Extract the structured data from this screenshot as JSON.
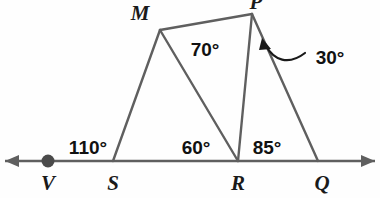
{
  "figure": {
    "background_color": "#fefefe",
    "stroke_color": "#5f5f5f",
    "label_color": "#111111",
    "line": {
      "name": "ray-VQ",
      "y": 161,
      "left_arrow_tip_x": 5,
      "right_arrow_tip_x": 375
    },
    "points": {
      "V": {
        "label": "V",
        "x": 48,
        "y": 161,
        "label_x": 48,
        "label_y": 190,
        "dot": true
      },
      "S": {
        "label": "S",
        "x": 113,
        "y": 161,
        "label_x": 113,
        "label_y": 190,
        "dot": false
      },
      "R": {
        "label": "R",
        "x": 238,
        "y": 161,
        "label_x": 238,
        "label_y": 190,
        "dot": false
      },
      "Q": {
        "label": "Q",
        "x": 318,
        "y": 161,
        "label_x": 322,
        "label_y": 190,
        "dot": false
      },
      "M": {
        "label": "M",
        "x": 160,
        "y": 30,
        "label_x": 140,
        "label_y": 20,
        "dot": false
      },
      "P": {
        "label": "P",
        "x": 252,
        "y": 14,
        "label_x": 256,
        "label_y": 2,
        "dot": false
      }
    },
    "segments": [
      {
        "name": "segment-SM",
        "from": "S",
        "to": "M"
      },
      {
        "name": "segment-MR",
        "from": "M",
        "to": "R"
      },
      {
        "name": "segment-MP",
        "from": "M",
        "to": "P"
      },
      {
        "name": "segment-PR",
        "from": "P",
        "to": "R"
      },
      {
        "name": "segment-PQ",
        "from": "P",
        "to": "Q"
      }
    ],
    "angles": [
      {
        "name": "angle-110",
        "value": "110°",
        "x": 88,
        "y": 147,
        "at_vertex": "S"
      },
      {
        "name": "angle-60",
        "value": "60°",
        "x": 196,
        "y": 147,
        "at_vertex": "R"
      },
      {
        "name": "angle-85",
        "value": "85°",
        "x": 267,
        "y": 147,
        "at_vertex": "R"
      },
      {
        "name": "angle-70",
        "value": "70°",
        "x": 205,
        "y": 49,
        "at_vertex": "M"
      },
      {
        "name": "angle-30",
        "value": "30°",
        "x": 330,
        "y": 57,
        "at_vertex": "P"
      }
    ],
    "leader": {
      "name": "leader-arrow-30",
      "arrow_tip_x": 263,
      "arrow_tip_y": 42,
      "tail_x": 305,
      "tail_y": 53
    }
  }
}
